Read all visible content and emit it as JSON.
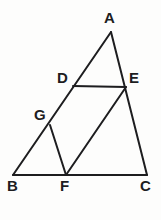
{
  "figure": {
    "kind": "geometry-diagram",
    "canvas": {
      "width": 161,
      "height": 220
    },
    "background_color": "#fdfdfc",
    "stroke_color": "#1d1d1f",
    "stroke_width": 2,
    "label_color": "#1d1d1f",
    "points": [
      {
        "id": "A",
        "label": "A",
        "x": 111,
        "y": 32,
        "label_x": 104,
        "label_y": 10
      },
      {
        "id": "B",
        "label": "B",
        "x": 13,
        "y": 175,
        "label_x": 7,
        "label_y": 178
      },
      {
        "id": "C",
        "label": "C",
        "x": 147,
        "y": 175,
        "label_x": 140,
        "label_y": 178
      },
      {
        "id": "D",
        "label": "D",
        "x": 73,
        "y": 86,
        "label_x": 57,
        "label_y": 70
      },
      {
        "id": "E",
        "label": "E",
        "x": 126,
        "y": 87,
        "label_x": 129,
        "label_y": 70
      },
      {
        "id": "F",
        "label": "F",
        "x": 66,
        "y": 175,
        "label_x": 60,
        "label_y": 178
      },
      {
        "id": "G",
        "label": "G",
        "x": 50,
        "y": 125,
        "label_x": 34,
        "label_y": 107
      }
    ],
    "segments": [
      {
        "id": "AB",
        "from": "A",
        "to": "B",
        "x1": 111,
        "y1": 32,
        "x2": 13,
        "y2": 175
      },
      {
        "id": "AC",
        "from": "A",
        "to": "C",
        "x1": 111,
        "y1": 32,
        "x2": 147,
        "y2": 175
      },
      {
        "id": "BC",
        "from": "B",
        "to": "C",
        "x1": 13,
        "y1": 175,
        "x2": 147,
        "y2": 175
      },
      {
        "id": "DE",
        "from": "D",
        "to": "E",
        "x1": 73,
        "y1": 86,
        "x2": 126,
        "y2": 87
      },
      {
        "id": "GF",
        "from": "G",
        "to": "F",
        "x1": 50,
        "y1": 125,
        "x2": 66,
        "y2": 175
      },
      {
        "id": "FE",
        "from": "F",
        "to": "E",
        "x1": 66,
        "y1": 175,
        "x2": 126,
        "y2": 87
      }
    ]
  }
}
